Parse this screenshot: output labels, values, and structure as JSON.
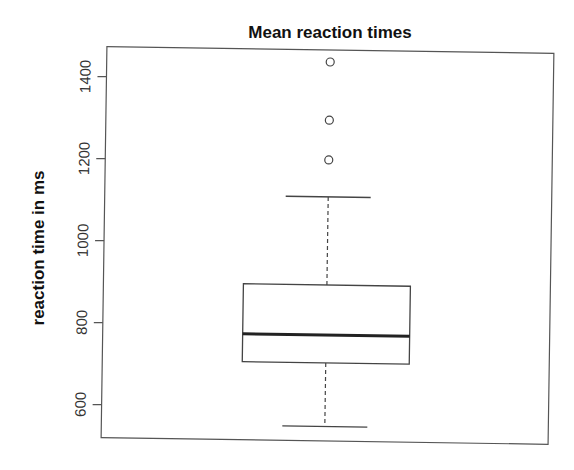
{
  "chart_data": {
    "type": "boxplot",
    "title": "Mean reaction times",
    "xlabel": "",
    "ylabel": "reaction time in ms",
    "ylim": [
      525,
      1500
    ],
    "yticks": [
      600,
      800,
      1000,
      1200,
      1400
    ],
    "ytick_labels": [
      "600",
      "800",
      "1000",
      "1200",
      "1400"
    ],
    "grid": false,
    "legend": null,
    "boxes": [
      {
        "name": "",
        "whisker_low": 555,
        "q1": 710,
        "median": 778,
        "q3": 900,
        "whisker_high": 1115,
        "outliers": [
          1205,
          1302,
          1444
        ]
      }
    ]
  }
}
